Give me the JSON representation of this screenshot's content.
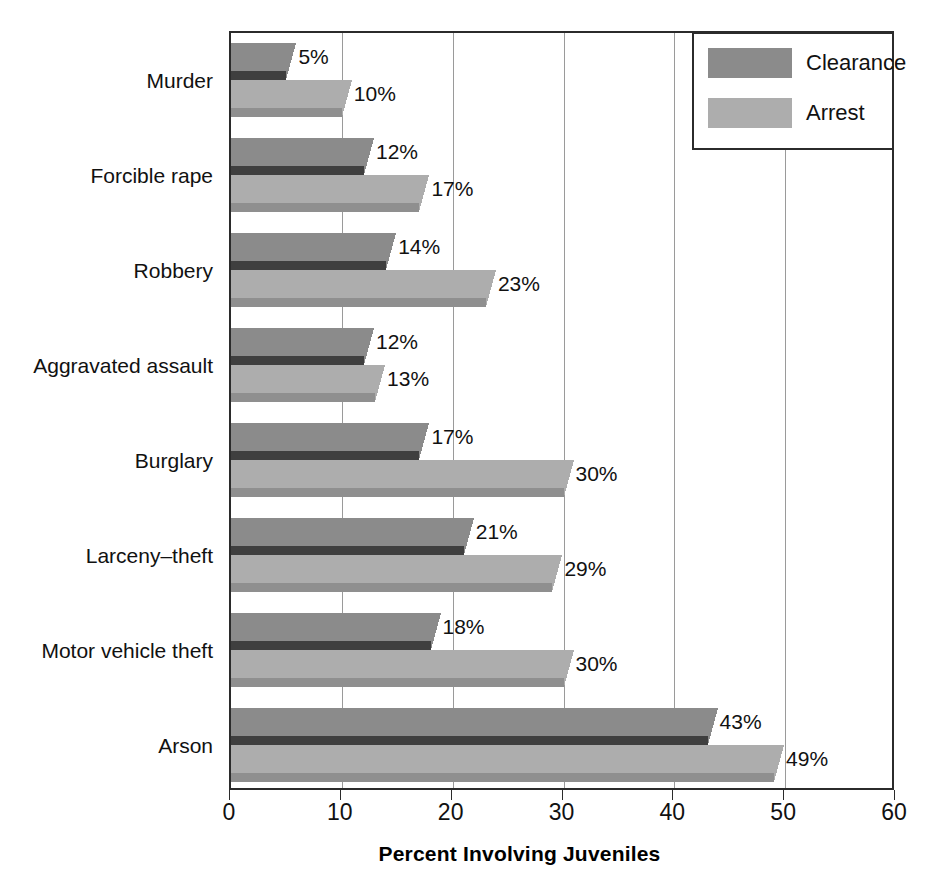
{
  "chart_data": {
    "type": "bar",
    "orientation": "horizontal",
    "title": "",
    "xlabel": "Percent Involving Juveniles",
    "ylabel": "",
    "xlim": [
      0,
      60
    ],
    "xticks": [
      "0",
      "10",
      "20",
      "30",
      "40",
      "50",
      "60"
    ],
    "grid": true,
    "legend_position": "top-right",
    "categories": [
      "Murder",
      "Forcible rape",
      "Robbery",
      "Aggravated assault",
      "Burglary",
      "Larceny–theft",
      "Motor vehicle theft",
      "Arson"
    ],
    "series": [
      {
        "name": "Clearance",
        "color": "#8b8b8b",
        "values": [
          5,
          12,
          14,
          12,
          17,
          21,
          18,
          43
        ],
        "labels": [
          "5%",
          "12%",
          "14%",
          "12%",
          "17%",
          "21%",
          "18%",
          "43%"
        ]
      },
      {
        "name": "Arrest",
        "color": "#adadad",
        "values": [
          10,
          17,
          23,
          13,
          30,
          29,
          30,
          49
        ],
        "labels": [
          "10%",
          "17%",
          "23%",
          "13%",
          "30%",
          "29%",
          "30%",
          "49%"
        ]
      }
    ]
  },
  "legend": {
    "entries": [
      {
        "label": "Clearance",
        "swatch": "clearance"
      },
      {
        "label": "Arrest",
        "swatch": "arrest"
      }
    ]
  }
}
